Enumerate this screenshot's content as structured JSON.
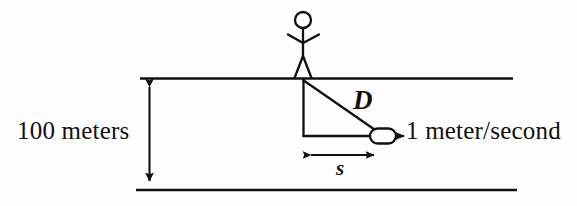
{
  "figure": {
    "background_color": "#fefefe",
    "stroke_color": "#101010",
    "labels": {
      "height": "100 meters",
      "speed": "1 meter/second",
      "hypotenuse": "D",
      "base": "s"
    },
    "elements": {
      "person": "stick-figure",
      "object": "boat",
      "top_bank": "riverbank-top-line",
      "bottom_bank": "riverbank-bottom-line",
      "height_dimension": "vertical-double-arrow",
      "base_dimension": "horizontal-double-arrow",
      "velocity_vector": "right-arrow"
    }
  },
  "geometry": {
    "top_line": {
      "x1": 140,
      "y1": 78,
      "x2": 513,
      "y2": 78
    },
    "bottom_line": {
      "x1": 136,
      "y1": 190,
      "x2": 517,
      "y2": 190
    },
    "height_arrow": {
      "x": 149,
      "y_top": 79,
      "y_bottom": 188
    },
    "person": {
      "head_cx": 303,
      "head_cy": 20,
      "head_r": 8,
      "ground_y": 78
    },
    "triangle": {
      "apex_x": 303,
      "apex_y": 80,
      "corner_x": 303,
      "corner_y": 136,
      "boat_x": 372,
      "boat_y": 136
    },
    "boat": {
      "x": 370,
      "y": 129,
      "w": 25,
      "h": 14
    },
    "velocity_arrow": {
      "x1": 395,
      "y": 136,
      "x2": 412
    },
    "base_arrow": {
      "x1": 303,
      "x2": 382,
      "y": 155
    }
  }
}
